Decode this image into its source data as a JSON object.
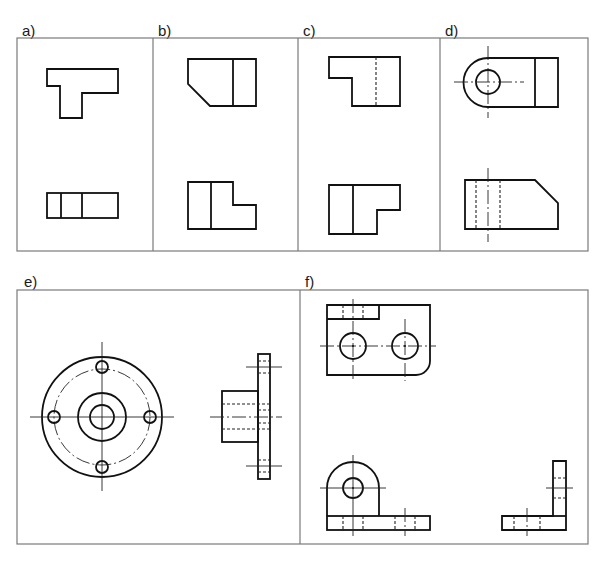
{
  "panels": [
    {
      "id": "a",
      "label": "a)",
      "views": [
        "top view: T-shaped outline",
        "front view: rectangle split into three"
      ]
    },
    {
      "id": "b",
      "label": "b)",
      "views": [
        "top view: rectangle with chamfered lower-left corner",
        "front view: L-shaped outline"
      ]
    },
    {
      "id": "c",
      "label": "c)",
      "views": [
        "top view: step outline with hidden line",
        "front view: L-shaped outline"
      ]
    },
    {
      "id": "d",
      "label": "d)",
      "views": [
        "top view: rounded end with hole",
        "front view: chamfered block with hidden hole"
      ]
    },
    {
      "id": "e",
      "label": "e)",
      "views": [
        "front view: flange with four bolt holes",
        "side view: hub with flange"
      ]
    },
    {
      "id": "f",
      "label": "f)",
      "views": [
        "top view: plate with two holes",
        "front view: bracket with rounded lug",
        "side view: L-profile"
      ]
    }
  ],
  "colors": {
    "frame": "#7a7a7a",
    "line": "#111111",
    "background": "#ffffff"
  }
}
